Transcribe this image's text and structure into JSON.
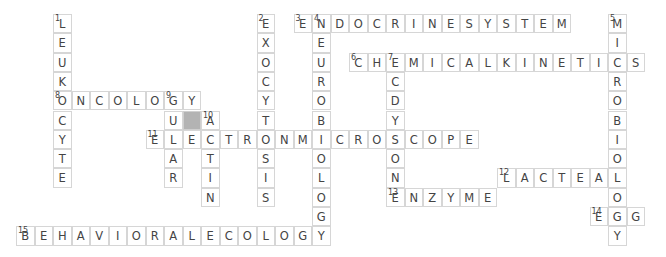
{
  "puzzle": {
    "cell_w": 18.5,
    "cell_h": 19.3,
    "colors": {
      "border": "#d6d6d6",
      "letter": "#444444",
      "block": "#b3b3b3",
      "background": "#ffffff"
    },
    "blocks": [
      {
        "row": 5,
        "col": 9
      }
    ],
    "words": [
      {
        "num": 1,
        "dir": "down",
        "row": 0,
        "col": 2,
        "answer": "LEUKOCYTE"
      },
      {
        "num": 2,
        "dir": "down",
        "row": 0,
        "col": 13,
        "answer": "EXOCYTOSIS"
      },
      {
        "num": 3,
        "dir": "across",
        "row": 0,
        "col": 15,
        "answer": "ENDOCRINESYSTEM"
      },
      {
        "num": 4,
        "dir": "down",
        "row": 0,
        "col": 16,
        "answer": "NEUROBIOLOGY"
      },
      {
        "num": 5,
        "dir": "down",
        "row": 0,
        "col": 32,
        "answer": "MICROBIOLOGY"
      },
      {
        "num": 6,
        "dir": "across",
        "row": 2,
        "col": 18,
        "answer": "CHEMICALKINETICS"
      },
      {
        "num": 7,
        "dir": "down",
        "row": 2,
        "col": 20,
        "answer": "ECDYSONE"
      },
      {
        "num": 8,
        "dir": "across",
        "row": 4,
        "col": 2,
        "answer": "ONCOLOGY"
      },
      {
        "num": 9,
        "dir": "down",
        "row": 4,
        "col": 8,
        "answer": "GULAR"
      },
      {
        "num": 10,
        "dir": "down",
        "row": 5,
        "col": 10,
        "answer": "ACTIN"
      },
      {
        "num": 11,
        "dir": "across",
        "row": 6,
        "col": 7,
        "answer": "ELECTRONMICROSCOPE"
      },
      {
        "num": 12,
        "dir": "across",
        "row": 8,
        "col": 26,
        "answer": "LACTEAL"
      },
      {
        "num": 13,
        "dir": "across",
        "row": 9,
        "col": 20,
        "answer": "ENZYME"
      },
      {
        "num": 14,
        "dir": "across",
        "row": 10,
        "col": 31,
        "answer": "EGG"
      },
      {
        "num": 15,
        "dir": "across",
        "row": 11,
        "col": 0,
        "answer": "BEHAVIORALECOLOGY"
      }
    ]
  }
}
